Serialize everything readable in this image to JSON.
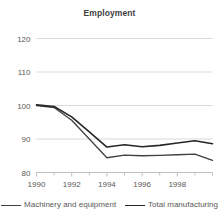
{
  "chart_data": {
    "type": "line",
    "title": "Employment",
    "xlabel": "",
    "ylabel": "",
    "xlim": [
      1990,
      2000
    ],
    "ylim": [
      80,
      120
    ],
    "yticks": [
      80,
      90,
      100,
      110,
      120
    ],
    "xticks": [
      1990,
      1992,
      1994,
      1996,
      1998
    ],
    "xticks_minor": [
      1991,
      1993,
      1995,
      1997,
      1999,
      2000
    ],
    "grid": "horizontal",
    "legend_position": "bottom",
    "x": [
      1990,
      1991,
      1992,
      1993,
      1994,
      1995,
      1996,
      1997,
      1998,
      1999,
      2000
    ],
    "series": [
      {
        "name": "Machinery and equipment",
        "color": "#404040",
        "width": 1.3,
        "values": [
          100.0,
          99.4,
          95.6,
          90.0,
          84.4,
          85.2,
          85.0,
          85.1,
          85.3,
          85.5,
          83.6
        ]
      },
      {
        "name": "Total manufacturing",
        "color": "#262626",
        "width": 1.6,
        "values": [
          100.2,
          99.7,
          96.6,
          92.1,
          87.6,
          88.3,
          87.7,
          88.1,
          88.8,
          89.5,
          88.6
        ]
      }
    ]
  },
  "axis": {
    "ytick_labels": [
      "120",
      "110",
      "100",
      "90",
      "80"
    ],
    "xtick_labels": [
      "1990",
      "1992",
      "1994",
      "1996",
      "1998"
    ]
  },
  "legend": {
    "entries": [
      {
        "label": "Machinery and equipment"
      },
      {
        "label": "Total manufacturing"
      }
    ]
  },
  "colors": {
    "grid": "#d9d9d9",
    "axis": "#bfbfbf",
    "text": "#595959",
    "title": "#404040",
    "background": "#ffffff"
  }
}
